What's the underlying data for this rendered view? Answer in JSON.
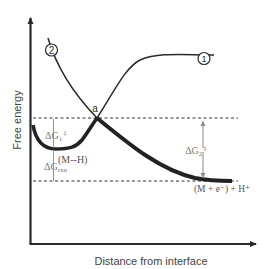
{
  "diagram": {
    "title": "",
    "axes": {
      "y_label": "Free energy",
      "x_label": "Distance from interface"
    },
    "curves": [
      {
        "id": "1",
        "label": "1",
        "description": "Rising curve, plateau at high energy"
      },
      {
        "id": "2",
        "label": "2",
        "description": "Falling curve from upper left to lower right"
      }
    ],
    "points": {
      "intersection": "a"
    },
    "states": {
      "adsorbed": "(M--H)",
      "products": "(M + e⁻) + H⁺"
    },
    "energies": {
      "dG1": {
        "symbol": "ΔG",
        "sub": "1",
        "sup": "‡"
      },
      "dG2": {
        "symbol": "ΔG",
        "sub": "2",
        "sup": "‡"
      },
      "dGrxn": {
        "symbol": "ΔG",
        "sub": "rxn"
      }
    },
    "colors": {
      "ink": "#2a2a2a",
      "arrow_grey": "#8a8a8a",
      "dash": "#333333"
    }
  }
}
